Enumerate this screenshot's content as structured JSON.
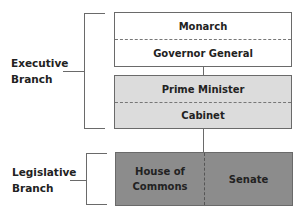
{
  "diagram": {
    "type": "hierarchy",
    "colors": {
      "executive_top_fill": "#ffffff",
      "executive_mid_fill": "#dcdcdc",
      "legislative_fill": "#8c8c8c",
      "border": "#6a6a6a",
      "text": "#222222"
    },
    "branches": [
      {
        "label_line1": "Executive",
        "label_line2": "Branch",
        "groups": [
          {
            "cells": [
              "Monarch",
              "Governor General"
            ]
          },
          {
            "cells": [
              "Prime Minister",
              "Cabinet"
            ]
          }
        ]
      },
      {
        "label_line1": "Legislative",
        "label_line2": "Branch",
        "groups": [
          {
            "cells_line": [
              "House of Commons",
              "Senate"
            ],
            "house_line1": "House of",
            "house_line2": "Commons"
          }
        ]
      }
    ]
  }
}
